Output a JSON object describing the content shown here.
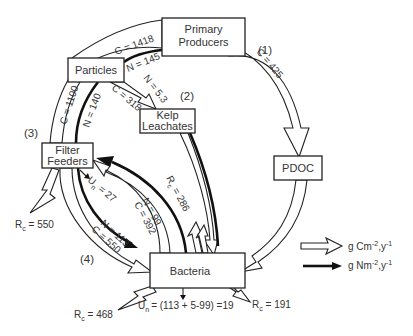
{
  "nodes": {
    "primary_producers": [
      "Primary",
      "Producers"
    ],
    "particles": "Particles",
    "kelp_leachates": [
      "Kelp",
      "Leachates"
    ],
    "filter_feeders": [
      "Filter",
      "Feeders"
    ],
    "pdoc": "PDOC",
    "bacteria": "Bacteria"
  },
  "pathway_labels": {
    "p1": "(1)",
    "p2": "(2)",
    "p3": "(3)",
    "p4": "(4)"
  },
  "flows": {
    "pp_to_particles_c": "C = 1418",
    "pp_to_particles_n": "N = 145",
    "particles_to_kelp_n": "N = 5.3",
    "particles_to_kelp_c": "C = 318",
    "pp_to_pdoc_c": "C = 425",
    "particles_to_ff_c": "C = 1100",
    "particles_to_ff_n": "N = 140",
    "ff_un": "27",
    "bacteria_to_ff_n": "N = 99",
    "bacteria_to_ff_c": "C = 392",
    "bacteria_rc_upper": "286",
    "ff_to_bacteria_n": "N = 113",
    "ff_to_bacteria_c": "C = 550",
    "ff_rc": "550",
    "bacteria_rc_left": "468",
    "bacteria_un": "= (113 + 5-99) =19",
    "bacteria_rc_right": "191"
  },
  "symbols": {
    "R": "R",
    "c_sub": "c",
    "U": "U",
    "n_sub": "n",
    "eq": " = "
  },
  "legend": {
    "carbon": {
      "text": "g Cm",
      "sup1": "-2",
      "mid": ",y",
      "sup2": "-1"
    },
    "nitrogen": {
      "text": "g Nm",
      "sup1": "-2",
      "mid": ",y",
      "sup2": "-1"
    }
  },
  "colors": {
    "line": "#222222",
    "text": "#333333",
    "background": "#ffffff"
  }
}
